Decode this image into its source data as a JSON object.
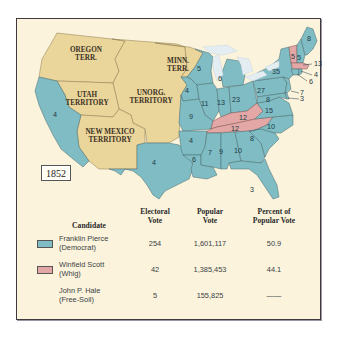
{
  "year": "1852",
  "colors": {
    "democrat": "#7fbcc4",
    "whig": "#e3a8a6",
    "territory": "#ead59a",
    "background": "#fbf3dc",
    "lakes": "#e4edf2",
    "border": "#3f3a40"
  },
  "territories": [
    {
      "name": "OREGON",
      "name2": "TERR."
    },
    {
      "name": "MINN.",
      "name2": "TERR."
    },
    {
      "name": "UTAH",
      "name2": "TERRITORY"
    },
    {
      "name": "UNORG.",
      "name2": "TERRITORY"
    },
    {
      "name": "NEW MEXICO",
      "name2": "TERRITORY"
    }
  ],
  "states": [
    {
      "name": "California",
      "ev": "4",
      "party": "democrat"
    },
    {
      "name": "Texas",
      "ev": "4",
      "party": "democrat"
    },
    {
      "name": "Wisconsin",
      "ev": "5",
      "party": "democrat"
    },
    {
      "name": "Iowa",
      "ev": "4",
      "party": "democrat"
    },
    {
      "name": "Michigan",
      "ev": "6",
      "party": "democrat"
    },
    {
      "name": "Illinois",
      "ev": "11",
      "party": "democrat"
    },
    {
      "name": "Indiana",
      "ev": "13",
      "party": "democrat"
    },
    {
      "name": "Ohio",
      "ev": "23",
      "party": "democrat"
    },
    {
      "name": "Missouri",
      "ev": "9",
      "party": "democrat"
    },
    {
      "name": "Arkansas",
      "ev": "4",
      "party": "democrat"
    },
    {
      "name": "Louisiana",
      "ev": "6",
      "party": "democrat"
    },
    {
      "name": "Mississippi",
      "ev": "7",
      "party": "democrat"
    },
    {
      "name": "Alabama",
      "ev": "9",
      "party": "democrat"
    },
    {
      "name": "Georgia",
      "ev": "10",
      "party": "democrat"
    },
    {
      "name": "Florida",
      "ev": "3",
      "party": "democrat"
    },
    {
      "name": "South Carolina",
      "ev": "8",
      "party": "democrat"
    },
    {
      "name": "North Carolina",
      "ev": "10",
      "party": "democrat"
    },
    {
      "name": "Virginia",
      "ev": "15",
      "party": "democrat"
    },
    {
      "name": "Kentucky",
      "ev": "12",
      "party": "whig"
    },
    {
      "name": "Tennessee",
      "ev": "12",
      "party": "whig"
    },
    {
      "name": "Pennsylvania",
      "ev": "27",
      "party": "democrat"
    },
    {
      "name": "Maryland",
      "ev": "8",
      "party": "democrat"
    },
    {
      "name": "New York",
      "ev": "35",
      "party": "democrat"
    },
    {
      "name": "New Jersey",
      "ev": "7",
      "party": "democrat"
    },
    {
      "name": "Delaware",
      "ev": "3",
      "party": "democrat"
    },
    {
      "name": "Vermont",
      "ev": "5",
      "party": "whig"
    },
    {
      "name": "New Hampshire",
      "ev": "5",
      "party": "democrat"
    },
    {
      "name": "Maine",
      "ev": "8",
      "party": "democrat"
    },
    {
      "name": "Massachusetts",
      "ev": "13",
      "party": "whig"
    },
    {
      "name": "Rhode Island",
      "ev": "4",
      "party": "democrat"
    },
    {
      "name": "Connecticut",
      "ev": "6",
      "party": "democrat"
    }
  ],
  "table": {
    "headers": {
      "candidate": "Candidate",
      "electoral_1": "Electoral",
      "electoral_2": "Vote",
      "popular_1": "Popular",
      "popular_2": "Vote",
      "percent_1": "Percent of",
      "percent_2": "Popular Vote"
    },
    "rows": [
      {
        "name": "Franklin Pierce",
        "party": "(Democrat)",
        "electoral": "254",
        "popular": "1,601,117",
        "percent": "50.9",
        "swatch": "democrat"
      },
      {
        "name": "Winfield Scott",
        "party": "(Whig)",
        "electoral": "42",
        "popular": "1,385,453",
        "percent": "44.1",
        "swatch": "whig"
      },
      {
        "name": "John P. Hale",
        "party": "(Free-Soil)",
        "electoral": "5",
        "popular": "155,825",
        "percent": "——",
        "swatch": null
      }
    ]
  }
}
